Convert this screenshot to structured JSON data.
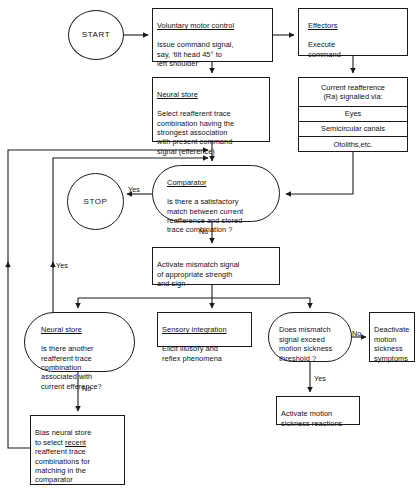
{
  "diagram": {
    "line_color": "#1a1a1a",
    "background": "#ffffff"
  },
  "nodes": {
    "start": {
      "label": "START"
    },
    "stop": {
      "label": "STOP"
    },
    "voluntary_motor_control": {
      "header": "Voluntary motor control",
      "body": "Issue command signal,\nsay, 'tilt head 45° to\nleft shoulder'"
    },
    "effectors": {
      "header": "Effectors",
      "body": "Execute\ncommand"
    },
    "neural_store_select": {
      "header": "Neural store",
      "body": "Select reafferent trace\ncombination having the\nstrongest association\nwith present command\nsignal (efference)"
    },
    "reafference_stack": {
      "header": "Current reafference\n(Ra) signalled via:",
      "rows": [
        "Eyes",
        "Semicircular canals",
        "Otoliths,etc."
      ]
    },
    "comparator": {
      "header": "Comparator",
      "body": "Is there a satisfactory\nmatch between current\nreafference and stored\ntrace combination ?"
    },
    "activate_mismatch": {
      "body": "Activate mismatch signal\nof appropriate strength\nand sign"
    },
    "neural_store_another": {
      "header": "Neural store",
      "body": "Is there another\nreafferent trace\ncombination\nassociated with\ncurrent efference?"
    },
    "sensory_integration": {
      "header": "Sensory integration",
      "body": "Elicit illusory and\nreflex phenomena"
    },
    "mismatch_threshold": {
      "body": "Does mismatch\nsignal exceed\nmotion sickness\nthreshold ?"
    },
    "deactivate_symptoms": {
      "body": "Deactivate\nmotion\nsickness\nsymptoms"
    },
    "activate_reactions": {
      "body": "Activate motion\nsickness reactions"
    },
    "bias_neural_store": {
      "body_pre": "Bias neural store\nto select ",
      "body_underline": "recent",
      "body_post": "\nreafferent trace\ncombinations for\nmatching in the\ncomparator"
    }
  },
  "edge_labels": {
    "comparator_yes": "Yes",
    "comparator_no": "No",
    "neural_store_yes": "Yes",
    "neural_store_no": "No",
    "threshold_no": "No",
    "threshold_yes": "Yes"
  }
}
